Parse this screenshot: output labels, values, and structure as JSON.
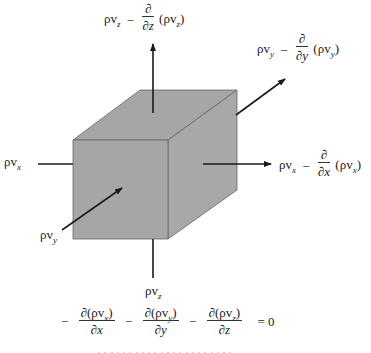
{
  "figure": {
    "type": "control-volume-mass-flux-diagram",
    "cube_color": "#a6a6a6",
    "edge_color": "#555555",
    "arrow_color": "#1a1a1a"
  },
  "labels": {
    "top": {
      "base": "ρv",
      "sub": "z",
      "minus": "−",
      "deriv_num": "∂",
      "deriv_den": "∂z",
      "paren_open": "(",
      "paren_base": "ρv",
      "paren_sub": "z",
      "paren_close": ")"
    },
    "back_right": {
      "base": "ρv",
      "sub": "y",
      "minus": "−",
      "deriv_num": "∂",
      "deriv_den": "∂y",
      "paren_open": "(",
      "paren_base": "ρv",
      "paren_sub": "y",
      "paren_close": ")"
    },
    "right": {
      "base": "ρv",
      "sub": "x",
      "minus": "−",
      "deriv_num": "∂",
      "deriv_den": "∂x",
      "paren_open": "(",
      "paren_base": "ρv",
      "paren_sub": "x",
      "paren_close": ")"
    },
    "left": {
      "base": "ρv",
      "sub": "x"
    },
    "front": {
      "base": "ρv",
      "sub": "y"
    },
    "bottom": {
      "base": "ρv",
      "sub": "z"
    }
  },
  "equation": {
    "terms": [
      {
        "sign": "−",
        "num_prefix": "∂(",
        "num_base": "ρv",
        "num_sub": "x",
        "num_suffix": ")",
        "den": "∂x"
      },
      {
        "sign": "−",
        "num_prefix": "∂(",
        "num_base": "ρv",
        "num_sub": "y",
        "num_suffix": ")",
        "den": "∂y"
      },
      {
        "sign": "−",
        "num_prefix": "∂(",
        "num_base": "ρv",
        "num_sub": "z",
        "num_suffix": ")",
        "den": "∂z"
      }
    ],
    "rhs": "= 0"
  },
  "caption_clipped": "ᐧ ᐧ ᐧ ᐧ ᐧ ᐧ ᐧ ᐧ ᐧ ᐧ ᐧ ᐧ ᐧ ᐧ ᐧ ᐧ ᐧ ᐧ ᐧ ᐧ ᐧ ᐧ"
}
